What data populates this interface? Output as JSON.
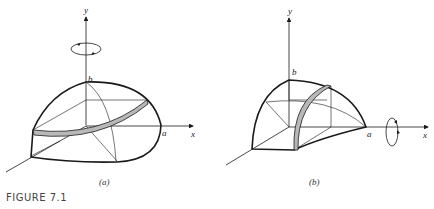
{
  "figure": {
    "caption": "FIGURE 7.1",
    "panels": [
      {
        "id": "a",
        "label": "(a)",
        "axis_labels": {
          "y": "y",
          "x": "x",
          "b": "b",
          "a": "a"
        },
        "rotation_axis": "y",
        "description": "Quarter of ellipsoid revolved about the y-axis with a horizontal shaded strip"
      },
      {
        "id": "b",
        "label": "(b)",
        "axis_labels": {
          "y": "y",
          "x": "x",
          "b": "b",
          "a": "a"
        },
        "rotation_axis": "x",
        "description": "Quarter of ellipsoid revolved about the x-axis with a vertical shaded strip"
      }
    ],
    "colors": {
      "line": "#1a1a1a",
      "strip": "#b8b8b8"
    }
  }
}
